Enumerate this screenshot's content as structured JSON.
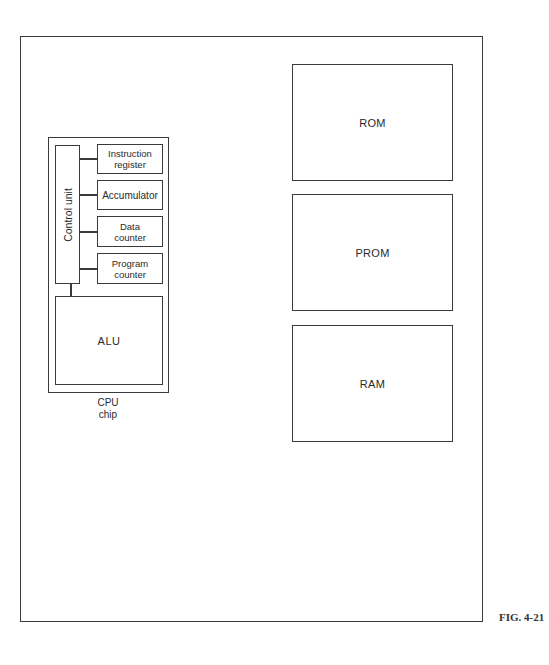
{
  "figure": {
    "label": "FIG. 4-21"
  },
  "cpu": {
    "caption_line1": "CPU",
    "caption_line2": "chip",
    "control_unit": "Control unit",
    "registers": [
      {
        "line1": "Instruction",
        "line2": "register"
      },
      {
        "line1": "Accumulator",
        "line2": ""
      },
      {
        "line1": "Data",
        "line2": "counter"
      },
      {
        "line1": "Program",
        "line2": "counter"
      }
    ],
    "alu": "ALU"
  },
  "memory": [
    {
      "label": "ROM"
    },
    {
      "label": "PROM"
    },
    {
      "label": "RAM"
    }
  ]
}
